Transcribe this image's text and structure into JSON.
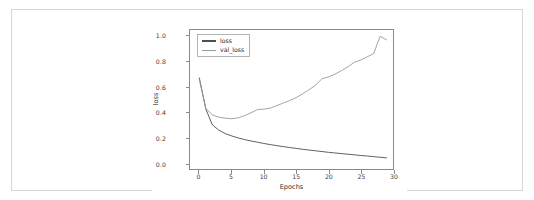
{
  "page": {
    "background": "#ffffff",
    "border_color": "#d6d6d6"
  },
  "chart_data": {
    "type": "line",
    "title": "",
    "subtitle": "",
    "xlabel": "Epochs",
    "ylabel": "loss",
    "xlim": [
      -1.45,
      30.0
    ],
    "ylim": [
      -0.05,
      1.05
    ],
    "xticks": [
      0,
      5,
      10,
      15,
      20,
      25,
      30
    ],
    "xtick_labels": [
      "0",
      "5",
      "10",
      "15",
      "20",
      "25",
      "30"
    ],
    "yticks": [
      0.0,
      0.2,
      0.4,
      0.6,
      0.8,
      1.0
    ],
    "ytick_labels": [
      "0.0",
      "0.2",
      "0.4",
      "0.6",
      "0.8",
      "1.0"
    ],
    "grid": false,
    "legend_position": "upper left",
    "x": [
      0,
      1,
      2,
      3,
      4,
      5,
      6,
      7,
      8,
      9,
      10,
      11,
      12,
      13,
      14,
      15,
      16,
      17,
      18,
      19,
      20,
      21,
      22,
      23,
      24,
      25,
      26,
      27,
      28,
      29
    ],
    "series": [
      {
        "name": "loss",
        "color": "#4f4f4f",
        "values": [
          0.67,
          0.425,
          0.3,
          0.258,
          0.23,
          0.212,
          0.196,
          0.183,
          0.172,
          0.162,
          0.152,
          0.143,
          0.135,
          0.127,
          0.12,
          0.113,
          0.106,
          0.1,
          0.094,
          0.088,
          0.082,
          0.077,
          0.072,
          0.067,
          0.062,
          0.057,
          0.053,
          0.048,
          0.043,
          0.038
        ]
      },
      {
        "name": "val_loss",
        "color": "#9a9a9a",
        "values": [
          0.655,
          0.43,
          0.378,
          0.36,
          0.352,
          0.348,
          0.355,
          0.372,
          0.395,
          0.42,
          0.424,
          0.432,
          0.452,
          0.472,
          0.492,
          0.515,
          0.545,
          0.578,
          0.612,
          0.665,
          0.678,
          0.7,
          0.728,
          0.758,
          0.795,
          0.812,
          0.838,
          0.862,
          1.0,
          0.972
        ]
      }
    ]
  },
  "legend": {
    "items": [
      {
        "label": "loss"
      },
      {
        "label": "val_loss"
      }
    ]
  }
}
